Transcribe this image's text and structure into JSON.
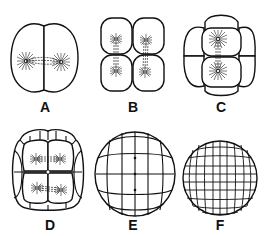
{
  "figure": {
    "background": "#ffffff",
    "line_color": "#111111",
    "panels": [
      {
        "id": "A",
        "label": "A",
        "description": "2-cell stage with mitotic spindles and asters",
        "cells": 2
      },
      {
        "id": "B",
        "label": "B",
        "description": "4-cell stage with spindles dividing",
        "cells": 4
      },
      {
        "id": "C",
        "label": "C",
        "description": "8-cell stage with spindle",
        "cells": 8
      },
      {
        "id": "D",
        "label": "D",
        "description": "16-cell stage with spindles",
        "cells": 16
      },
      {
        "id": "E",
        "label": "E",
        "description": "32-cell stage (morula)",
        "cells": 32
      },
      {
        "id": "F",
        "label": "F",
        "description": "many-celled blastula",
        "cells": "many"
      }
    ]
  }
}
